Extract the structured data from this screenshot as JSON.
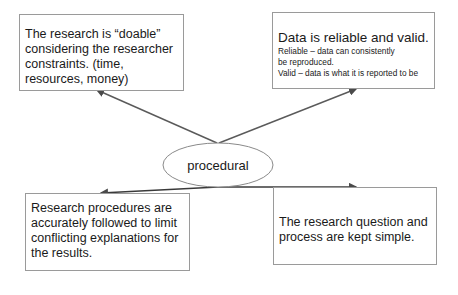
{
  "diagram": {
    "center": {
      "label": "procedural"
    },
    "boxes": {
      "top_left": {
        "text": "The research is  “doable” considering the researcher constraints. (time, resources, money)"
      },
      "top_right": {
        "heading": "Data is reliable and valid.",
        "lines": [
          "Reliable  – data can consistently",
          "be reproduced.",
          "Valid  – data is  what it is  reported to be"
        ]
      },
      "bottom_left": {
        "text": "Research procedures are accurately followed to limit conflicting explanations for the results."
      },
      "bottom_right": {
        "text": "The research question and process are kept simple."
      }
    },
    "colors": {
      "box_border": "#9a9a9a",
      "line": "#4a4a4a",
      "ellipse_border": "#8a8a8a",
      "text": "#1a1a1a"
    }
  }
}
